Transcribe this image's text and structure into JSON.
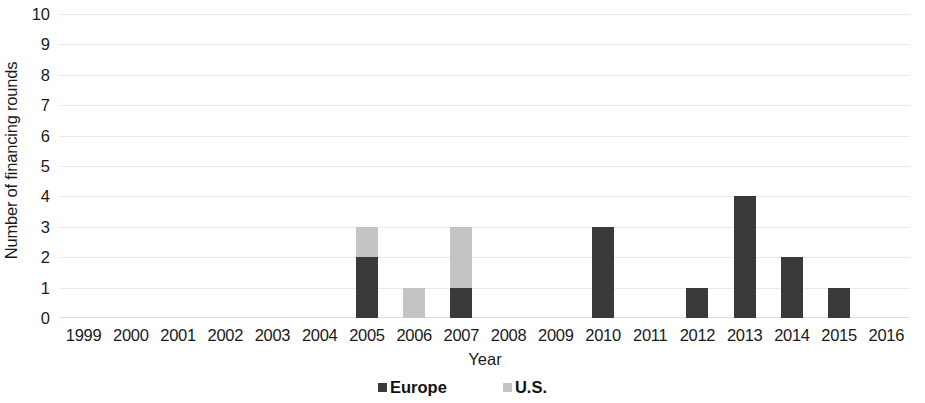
{
  "chart_data": {
    "type": "bar",
    "subtype": "stacked-bar",
    "title": "",
    "xlabel": "Year",
    "ylabel": "Number of financing rounds",
    "categories": [
      "1999",
      "2000",
      "2001",
      "2002",
      "2003",
      "2004",
      "2005",
      "2006",
      "2007",
      "2008",
      "2009",
      "2010",
      "2011",
      "2012",
      "2013",
      "2014",
      "2015",
      "2016"
    ],
    "series": [
      {
        "name": "Europe",
        "color": "#3a3a3a",
        "values": [
          0,
          0,
          0,
          0,
          0,
          0,
          2,
          0,
          1,
          0,
          0,
          3,
          0,
          1,
          4,
          2,
          1,
          0
        ]
      },
      {
        "name": "U.S.",
        "color": "#c4c4c4",
        "values": [
          0,
          0,
          0,
          0,
          0,
          0,
          1,
          1,
          2,
          0,
          0,
          0,
          0,
          0,
          0,
          0,
          0,
          0
        ]
      }
    ],
    "ylim": [
      0,
      10
    ],
    "ytick_step": 1,
    "yticks": [
      "10",
      "9",
      "8",
      "7",
      "6",
      "5",
      "4",
      "3",
      "2",
      "1",
      "0"
    ],
    "grid": true,
    "grid_color": "#e9e9e9",
    "legend_position": "bottom-center",
    "legend": [
      {
        "label": "Europe",
        "color": "#3a3a3a"
      },
      {
        "label": "U.S.",
        "color": "#c4c4c4"
      }
    ],
    "background_color": "#ffffff"
  }
}
